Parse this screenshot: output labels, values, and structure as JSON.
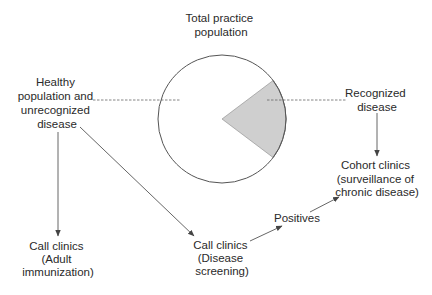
{
  "diagram": {
    "colors": {
      "stroke": "#555555",
      "wedge_fill": "#cfcfcf",
      "text": "#2a2a2a",
      "background": "#ffffff"
    },
    "nodes": {
      "total_population": {
        "lines": [
          "Total practice",
          "population"
        ]
      },
      "healthy": {
        "lines": [
          "Healthy",
          "population and",
          "unrecognized",
          "disease"
        ]
      },
      "recognized": {
        "lines": [
          "Recognized",
          "disease"
        ]
      },
      "cohort_clinics": {
        "lines": [
          "Cohort clinics",
          "(surveillance of",
          "chronic disease)"
        ]
      },
      "adult_immunization": {
        "lines": [
          "Call clinics",
          "(Adult",
          "immunization)"
        ]
      },
      "disease_screening": {
        "lines": [
          "Call clinics",
          "(Disease",
          "screening)"
        ]
      },
      "positives": {
        "lines": [
          "Positives"
        ]
      }
    },
    "pie": {
      "center": [
        222,
        119
      ],
      "radius": 64,
      "recognized_wedge_degrees": [
        -37,
        37
      ]
    },
    "edges": [
      {
        "from": "healthy",
        "to": "adult_immunization"
      },
      {
        "from": "healthy",
        "to": "disease_screening"
      },
      {
        "from": "disease_screening",
        "to": "positives"
      },
      {
        "from": "positives",
        "to": "cohort_clinics"
      },
      {
        "from": "recognized",
        "to": "cohort_clinics"
      }
    ]
  }
}
